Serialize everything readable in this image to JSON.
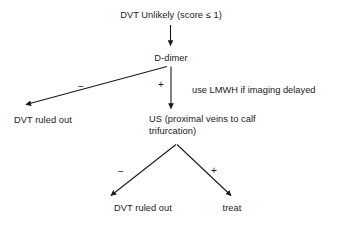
{
  "diagram": {
    "title_node": {
      "label": "DVT Unlikely (score ≤ 1)"
    },
    "nodes": [
      {
        "id": "d-dimer",
        "label": "D-dimer"
      },
      {
        "id": "dvt-ruled-out-left",
        "label": "DVT ruled out"
      },
      {
        "id": "ultrasound",
        "label": "US (proximal veins to calf\ntrifurcation)"
      },
      {
        "id": "dvt-ruled-out-bottom",
        "label": "DVT ruled out"
      },
      {
        "id": "treat",
        "label": "treat"
      }
    ],
    "edge_labels": {
      "d_dimer_negative": "−",
      "d_dimer_positive": "+",
      "us_negative": "−",
      "us_positive": "+"
    },
    "annotations": [
      {
        "id": "lmwh-note",
        "text": "use LMWH if imaging delayed"
      }
    ],
    "colors": {
      "background": "#ffffff",
      "text": "#1a1a1a",
      "edge": "#1a1a1a"
    }
  }
}
